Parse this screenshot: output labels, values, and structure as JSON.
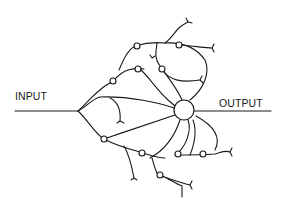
{
  "diagram": {
    "labels": {
      "input": "INPUT",
      "output": "OUTPUT"
    },
    "colors": {
      "stroke": "#1a1a1a",
      "background": "#ffffff"
    },
    "nodes": {
      "central_node": {
        "cx": 184,
        "cy": 110,
        "r": 10
      },
      "synapse_count": 12
    }
  }
}
